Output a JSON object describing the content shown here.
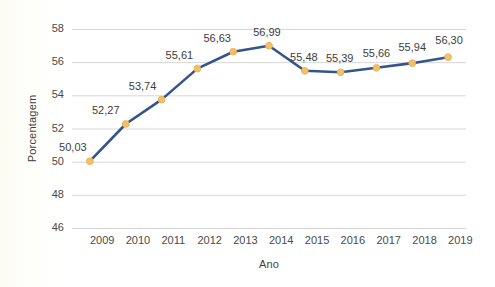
{
  "chart_data": {
    "type": "line",
    "title": "",
    "xlabel": "Ano",
    "ylabel": "Porcentagem",
    "categories": [
      "2009",
      "2010",
      "2011",
      "2012",
      "2013",
      "2014",
      "2015",
      "2016",
      "2017",
      "2018",
      "2019"
    ],
    "values": [
      50.03,
      52.27,
      53.74,
      55.61,
      56.63,
      56.99,
      55.48,
      55.39,
      55.66,
      55.94,
      56.3
    ],
    "data_labels": [
      "50,03",
      "52,27",
      "53,74",
      "55,61",
      "56,63",
      "56,99",
      "55,48",
      "55,39",
      "55,66",
      "55,94",
      "56,30"
    ],
    "ylim": [
      46,
      58
    ],
    "yticks": [
      46,
      48,
      50,
      52,
      54,
      56,
      58
    ],
    "ytick_labels": [
      "46",
      "48",
      "50",
      "52",
      "54",
      "56",
      "58"
    ],
    "grid": true,
    "grid_axis": "y",
    "legend": "none",
    "series": [
      {
        "name": "Porcentagem",
        "line_color": "#33548c",
        "marker_color": "#f3c06a",
        "marker_edge_color": "#e8b04e",
        "values": [
          50.03,
          52.27,
          53.74,
          55.61,
          56.63,
          56.99,
          55.48,
          55.39,
          55.66,
          55.94,
          56.3
        ]
      }
    ]
  },
  "style": {
    "background": "#fffffc",
    "grid_color": "#d6d6d6",
    "tick_text_color": "#4a4a4a",
    "label_text_color": "#3d3d3d",
    "axis_title_color": "#3f3f3f"
  }
}
